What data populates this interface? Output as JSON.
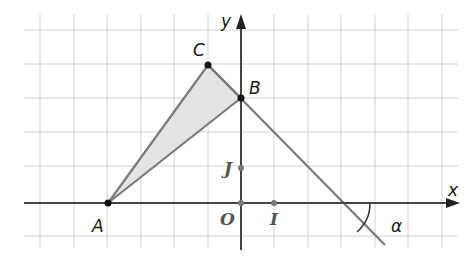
{
  "diagram": {
    "type": "coordinate-geometry",
    "grid": {
      "spacing_px": 33.5,
      "origin_px": [
        241,
        203
      ],
      "x_range": [
        -6,
        6
      ],
      "y_range": [
        -1,
        5
      ],
      "color": "#cfcfcf"
    },
    "axes": {
      "x_label": "x",
      "y_label": "y",
      "color": "#333333"
    },
    "points": [
      {
        "name": "A",
        "label": "A",
        "coords": [
          -4,
          0
        ]
      },
      {
        "name": "B",
        "label": "B",
        "coords": [
          0,
          3
        ]
      },
      {
        "name": "C",
        "label": "C",
        "coords": [
          -1,
          4
        ]
      },
      {
        "name": "O",
        "label": "O",
        "coords": [
          0,
          0
        ]
      },
      {
        "name": "I",
        "label": "I",
        "coords": [
          1,
          0
        ]
      },
      {
        "name": "J",
        "label": "J",
        "coords": [
          0,
          1
        ]
      }
    ],
    "triangle": {
      "vertices": [
        "A",
        "B",
        "C"
      ],
      "fill": "#e3e3e3",
      "stroke": "#777777"
    },
    "line_cb": {
      "through": [
        "C",
        "B"
      ],
      "slope": -1,
      "x_intercept": 3,
      "color": "#777777"
    },
    "angle": {
      "label": "α",
      "between": [
        "x-axis",
        "line CB"
      ]
    }
  }
}
